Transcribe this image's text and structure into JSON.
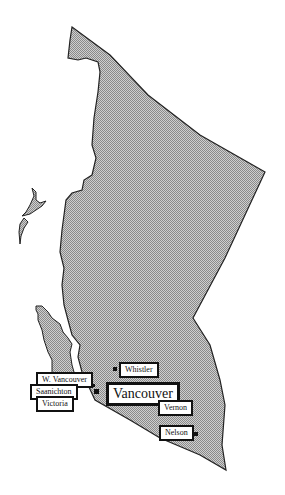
{
  "map": {
    "region": "British Columbia",
    "fill_pattern": "gray-dither",
    "outline_color": "#222222"
  },
  "cities": [
    {
      "name": "Whistler",
      "key": "whistler"
    },
    {
      "name": "W. Vancouver",
      "key": "w_vancouver"
    },
    {
      "name": "Saanichton",
      "key": "saanichton"
    },
    {
      "name": "Victoria",
      "key": "victoria"
    },
    {
      "name": "Vancouver",
      "key": "vancouver"
    },
    {
      "name": "Vernon",
      "key": "vernon"
    },
    {
      "name": "Nelson",
      "key": "nelson"
    }
  ]
}
